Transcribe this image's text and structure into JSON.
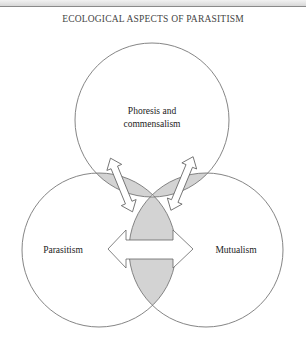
{
  "figure": {
    "title": "ECOLOGICAL ASPECTS OF PARASITISM",
    "circles": [
      {
        "id": "top",
        "label_lines": [
          "Phoresis and",
          "commensalism"
        ]
      },
      {
        "id": "left",
        "label_lines": [
          "Parasitism"
        ]
      },
      {
        "id": "right",
        "label_lines": [
          "Mutualism"
        ]
      }
    ],
    "arrows": [
      {
        "from": "Phoresis and commensalism",
        "to": "Parasitism",
        "type": "double-headed"
      },
      {
        "from": "Phoresis and commensalism",
        "to": "Mutualism",
        "type": "double-headed"
      },
      {
        "from": "Parasitism",
        "to": "Mutualism",
        "type": "double-headed"
      }
    ],
    "colors": {
      "circle_stroke": "#777777",
      "overlap_fill": "#d3d3d3",
      "arrow_fill": "#ffffff",
      "arrow_stroke": "#666666",
      "text": "#222222"
    }
  }
}
